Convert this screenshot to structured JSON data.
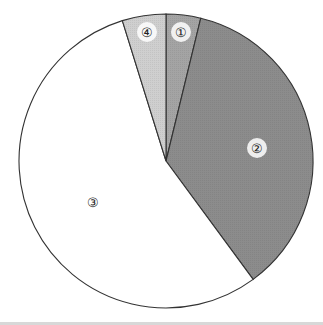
{
  "chart_data": {
    "type": "pie",
    "title": "",
    "start_angle_deg": 0,
    "direction": "clockwise",
    "categories": [
      "①",
      "②",
      "③",
      "④"
    ],
    "values": [
      3.8,
      36.1,
      55.3,
      4.8
    ],
    "values_rounded_percent": [
      4,
      36,
      55,
      5
    ],
    "colors": [
      "#a4a4a4",
      "#8c8c8c",
      "#ffffff",
      "#cfcfcf"
    ],
    "labels_inside": true,
    "legend": null
  },
  "geometry": {
    "cx": 166,
    "cy": 161,
    "r": 147
  },
  "labels": [
    {
      "text": "①",
      "x": 181,
      "y": 32
    },
    {
      "text": "②",
      "x": 257,
      "y": 148
    },
    {
      "text": "③",
      "x": 93,
      "y": 202
    },
    {
      "text": "④",
      "x": 147,
      "y": 32
    }
  ]
}
